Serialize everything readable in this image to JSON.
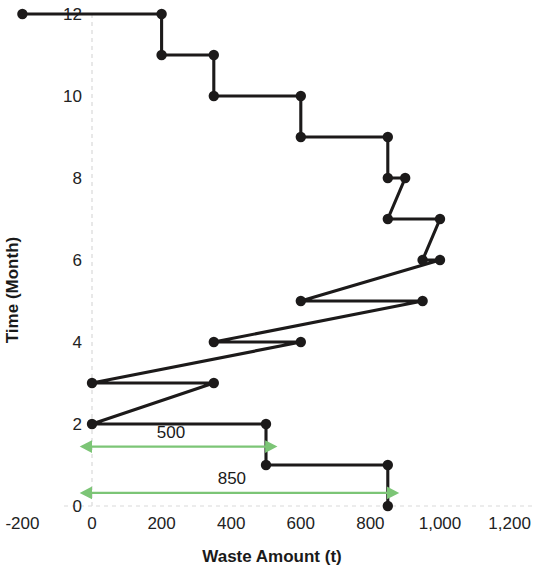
{
  "chart_data": {
    "type": "line",
    "subtype": "step-staircase",
    "title": "",
    "xlabel": "Waste Amount (t)",
    "ylabel": "Time (Month)",
    "xlim": [
      -200,
      1200
    ],
    "ylim": [
      0,
      12
    ],
    "xticks": [
      -200,
      0,
      200,
      400,
      600,
      800,
      1000,
      1200
    ],
    "xtick_labels": [
      "-200",
      "0",
      "200",
      "400",
      "600",
      "800",
      "1,000",
      "1,200"
    ],
    "yticks": [
      0,
      2,
      4,
      6,
      8,
      10,
      12
    ],
    "ytick_labels": [
      "0",
      "2",
      "4",
      "6",
      "8",
      "10",
      "12"
    ],
    "grid": "x-zero-only",
    "legend": "none",
    "series_color": "#1c1a1a",
    "annotation_color": "#7cc576",
    "steps": [
      {
        "month": 12,
        "x_start": -200,
        "x_end": 200
      },
      {
        "month": 11,
        "x_start": 200,
        "x_end": 350
      },
      {
        "month": 10,
        "x_start": 350,
        "x_end": 600
      },
      {
        "month": 9,
        "x_start": 600,
        "x_end": 850
      },
      {
        "month": 8,
        "x_start": 850,
        "x_end": 900
      },
      {
        "month": 7,
        "x_start": 850,
        "x_end": 1000
      },
      {
        "month": 6,
        "x_start": 950,
        "x_end": 1000
      },
      {
        "month": 5,
        "x_start": 600,
        "x_end": 950
      },
      {
        "month": 4,
        "x_start": 350,
        "x_end": 600
      },
      {
        "month": 3,
        "x_start": 0,
        "x_end": 350
      },
      {
        "month": 2,
        "x_start": 0,
        "x_end": 500
      },
      {
        "month": 1,
        "x_start": 500,
        "x_end": 850
      },
      {
        "month": 0,
        "x_start": 850,
        "x_end": 850
      }
    ],
    "points": [
      {
        "x": -200,
        "y": 12
      },
      {
        "x": 200,
        "y": 12
      },
      {
        "x": 200,
        "y": 11
      },
      {
        "x": 350,
        "y": 11
      },
      {
        "x": 350,
        "y": 10
      },
      {
        "x": 600,
        "y": 10
      },
      {
        "x": 600,
        "y": 9
      },
      {
        "x": 850,
        "y": 9
      },
      {
        "x": 850,
        "y": 8
      },
      {
        "x": 900,
        "y": 8
      },
      {
        "x": 850,
        "y": 7
      },
      {
        "x": 1000,
        "y": 7
      },
      {
        "x": 950,
        "y": 6
      },
      {
        "x": 1000,
        "y": 6
      },
      {
        "x": 600,
        "y": 5
      },
      {
        "x": 950,
        "y": 5
      },
      {
        "x": 350,
        "y": 4
      },
      {
        "x": 600,
        "y": 4
      },
      {
        "x": 0,
        "y": 3
      },
      {
        "x": 350,
        "y": 3
      },
      {
        "x": 0,
        "y": 2
      },
      {
        "x": 500,
        "y": 2
      },
      {
        "x": 500,
        "y": 1
      },
      {
        "x": 850,
        "y": 1
      },
      {
        "x": 850,
        "y": 0
      }
    ],
    "annotations": [
      {
        "label": "500",
        "x_from": 0,
        "x_to": 500,
        "y": 1.45,
        "style": "double-arrow"
      },
      {
        "label": "850",
        "x_from": 0,
        "x_to": 850,
        "y": 0.32,
        "style": "double-arrow"
      }
    ]
  }
}
